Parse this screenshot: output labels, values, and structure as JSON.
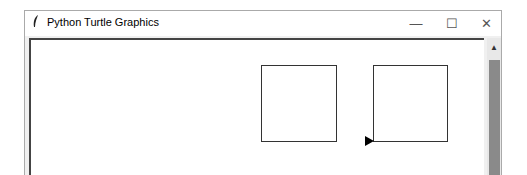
{
  "window": {
    "title": "Python Turtle Graphics",
    "app_icon": "feather-icon",
    "controls": {
      "minimize": "—",
      "maximize": "☐",
      "close": "✕"
    }
  },
  "scrollbar": {
    "up_arrow": "▲",
    "orientation": "vertical"
  },
  "canvas": {
    "background": "#ffffff",
    "shapes": [
      {
        "type": "square",
        "label": "left-square"
      },
      {
        "type": "square",
        "label": "right-square"
      }
    ],
    "turtle": {
      "shape": "arrow",
      "heading": "east",
      "color": "#000000"
    }
  }
}
